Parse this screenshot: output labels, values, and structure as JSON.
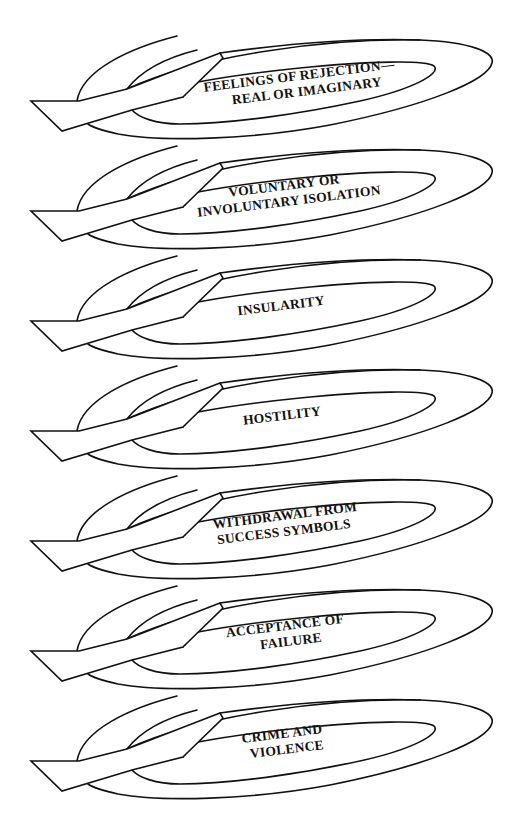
{
  "diagram": {
    "units": [
      {
        "lines": [
          "FEELINGS OF REJECTION—",
          "REAL OR IMAGINARY"
        ]
      },
      {
        "lines": [
          "VOLUNTARY OR",
          "INVOLUNTARY ISOLATION"
        ]
      },
      {
        "lines": [
          "INSULARITY"
        ]
      },
      {
        "lines": [
          "HOSTILITY"
        ]
      },
      {
        "lines": [
          "WITHDRAWAL FROM",
          "SUCCESS SYMBOLS"
        ]
      },
      {
        "lines": [
          "ACCEPTANCE OF",
          "FAILURE"
        ]
      },
      {
        "lines": [
          "CRIME AND",
          "VIOLENCE"
        ]
      }
    ],
    "colors": {
      "line": "#111111",
      "background": "#ffffff"
    }
  }
}
